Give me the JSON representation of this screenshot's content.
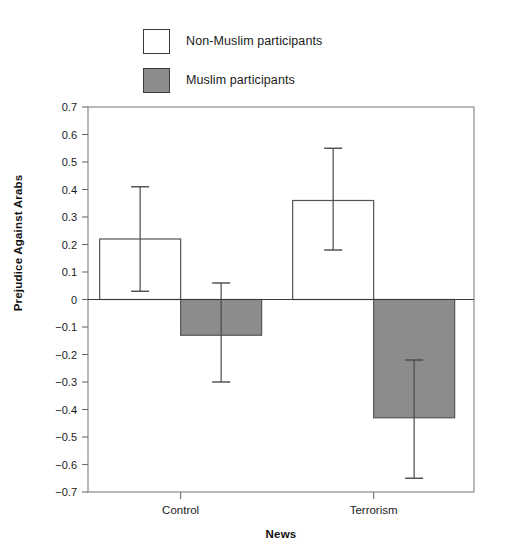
{
  "chart_data": {
    "type": "bar",
    "title": "",
    "subtitle": "",
    "xlabel": "News",
    "ylabel": "Prejudice Against Arabs",
    "categories": [
      "Control",
      "Terrorism"
    ],
    "ylim": [
      -0.7,
      0.7
    ],
    "ytick_step": 0.1,
    "ytick_labels": [
      "0.7",
      "0.6",
      "0.5",
      "0.4",
      "0.3",
      "0.2",
      "0.1",
      "0",
      "−0.1",
      "−0.2",
      "−0.3",
      "−0.4",
      "−0.5",
      "−0.6",
      "−0.7"
    ],
    "ytick_values": [
      0.7,
      0.6,
      0.5,
      0.4,
      0.3,
      0.2,
      0.1,
      0,
      -0.1,
      -0.2,
      -0.3,
      -0.4,
      -0.5,
      -0.6,
      -0.7
    ],
    "grid": false,
    "legend_position": "top-left",
    "zero_line": true,
    "error_bars": "confidence-interval",
    "series": [
      {
        "name": "Non-Muslim participants",
        "fill": "#ffffff",
        "stroke": "#555555",
        "values": [
          0.22,
          0.36
        ],
        "error_low": [
          0.03,
          0.18
        ],
        "error_high": [
          0.41,
          0.55
        ]
      },
      {
        "name": "Muslim participants",
        "fill": "#8c8c8c",
        "stroke": "#555555",
        "values": [
          -0.13,
          -0.43
        ],
        "error_low": [
          -0.3,
          -0.65
        ],
        "error_high": [
          0.06,
          -0.22
        ]
      }
    ]
  },
  "legend": {
    "items": [
      {
        "label": "Non-Muslim participants",
        "swatch": "white"
      },
      {
        "label": "Muslim participants",
        "swatch": "gray"
      }
    ]
  },
  "axes": {
    "y_title": "Prejudice Against Arabs",
    "x_title": "News"
  },
  "colors": {
    "muslim_bar": "#8c8c8c",
    "non_muslim_bar": "#ffffff",
    "axis": "#6e6e6e",
    "text": "#1a1a1a"
  }
}
